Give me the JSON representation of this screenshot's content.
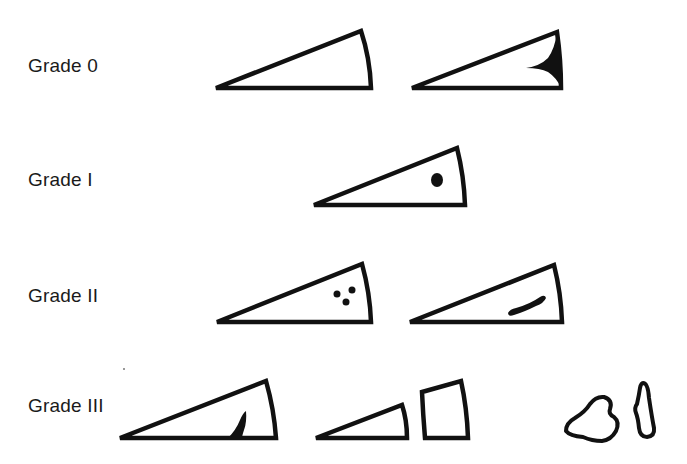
{
  "diagram": {
    "type": "grading-illustration",
    "colors": {
      "ink": "#111111",
      "background": "#ffffff"
    },
    "rows": [
      {
        "label": "Grade 0",
        "figures": [
          {
            "name": "normal-wedge",
            "description": "Triangular wedge, homogeneous low signal"
          },
          {
            "name": "wedge-with-dark-apex-recess",
            "description": "Triangular wedge with solid dark region along the outer margin"
          }
        ]
      },
      {
        "label": "Grade I",
        "figures": [
          {
            "name": "wedge-with-single-dot",
            "description": "Triangular wedge with a single round focal signal"
          }
        ]
      },
      {
        "label": "Grade II",
        "figures": [
          {
            "name": "wedge-with-three-dots",
            "description": "Triangular wedge with three small focal signals"
          },
          {
            "name": "wedge-with-linear-streak",
            "description": "Triangular wedge with linear signal not reaching surface"
          }
        ]
      },
      {
        "label": "Grade III",
        "figures": [
          {
            "name": "wedge-with-surface-extending-tear",
            "description": "Triangular wedge with signal extending to the articular surface"
          },
          {
            "name": "split-wedge-fragments",
            "description": "Small triangle and separate quadrilateral fragment"
          },
          {
            "name": "irregular-fragments",
            "description": "Irregular blob and elongated sliver"
          }
        ]
      }
    ]
  }
}
